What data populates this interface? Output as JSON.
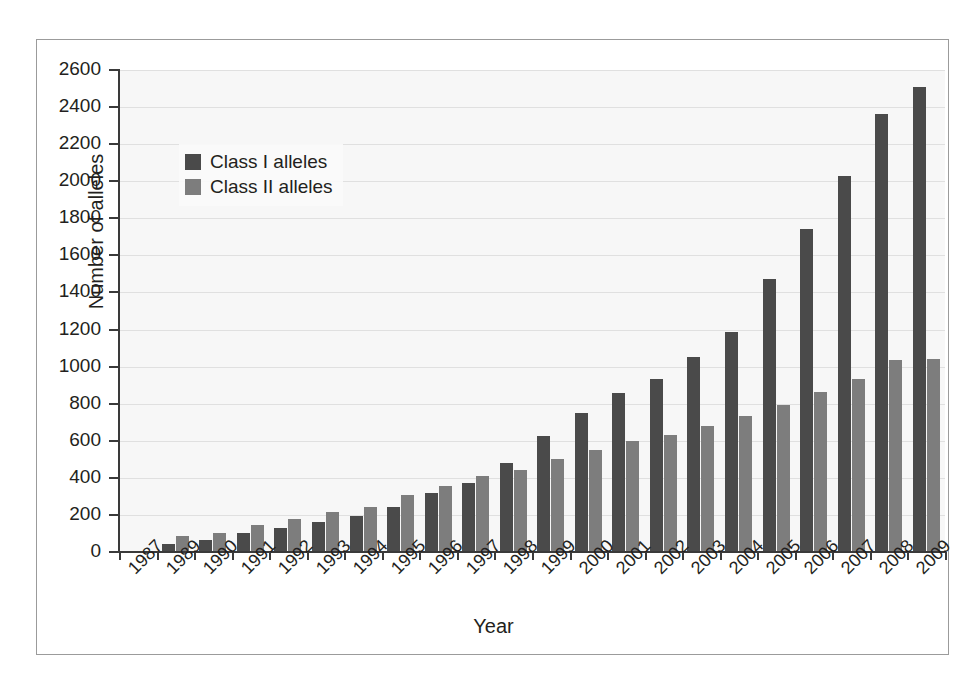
{
  "chart_data": {
    "type": "bar",
    "title": "",
    "xlabel": "Year",
    "ylabel": "Number of alleles",
    "categories": [
      "1987",
      "1989",
      "1990",
      "1991",
      "1992",
      "1993",
      "1994",
      "1995",
      "1996",
      "1997",
      "1998",
      "1999",
      "2000",
      "2001",
      "2002",
      "2003",
      "2004",
      "2005",
      "2006",
      "2007",
      "2008",
      "2009"
    ],
    "series": [
      {
        "name": "Class I alleles",
        "color": "#4a4a4a",
        "values": [
          null,
          45,
          65,
          100,
          130,
          160,
          195,
          245,
          320,
          370,
          480,
          625,
          750,
          860,
          935,
          1050,
          1185,
          1475,
          1740,
          2030,
          2365,
          2510
        ]
      },
      {
        "name": "Class II alleles",
        "color": "#7d7d7d",
        "values": [
          null,
          85,
          100,
          145,
          180,
          215,
          245,
          305,
          355,
          410,
          440,
          500,
          550,
          600,
          630,
          680,
          735,
          795,
          865,
          935,
          1035,
          1040
        ]
      }
    ],
    "ylim": [
      0,
      2600
    ],
    "ytick_step": 200,
    "yticks": [
      0,
      200,
      400,
      600,
      800,
      1000,
      1200,
      1400,
      1600,
      1800,
      2000,
      2200,
      2400,
      2600
    ],
    "ytick_labels": [
      "0",
      "200",
      "400",
      "600",
      "800",
      "1000",
      "1200",
      "1400",
      "1600",
      "1800",
      "2000",
      "2200",
      "2400",
      "2600"
    ],
    "grid": true,
    "grid_axis": "y",
    "legend_position": "top-left",
    "plot_background": "#f7f7f7",
    "frame_border_color": "#9b9b9b",
    "axis_color": "#3a3a3a",
    "text_color": "#231f20"
  }
}
